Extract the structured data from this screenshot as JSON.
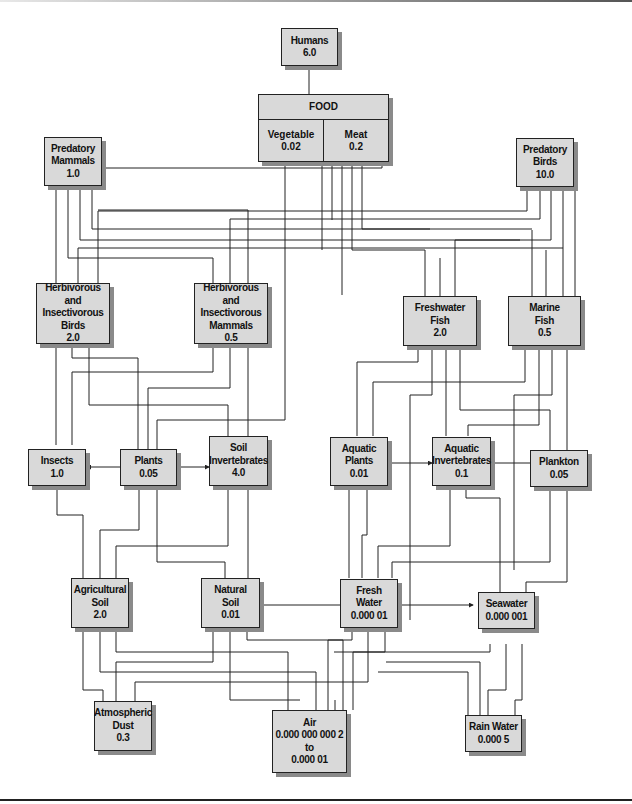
{
  "diagram": {
    "type": "food-web / environmental transfer flow diagram",
    "nodes": {
      "humans": {
        "name": "Humans",
        "value": "6.0"
      },
      "food": {
        "name": "FOOD",
        "vegetable_label": "Vegetable",
        "vegetable_value": "0.02",
        "meat_label": "Meat",
        "meat_value": "0.2"
      },
      "predatory_mammals": {
        "line1": "Predatory",
        "line2": "Mammals",
        "value": "1.0"
      },
      "predatory_birds": {
        "line1": "Predatory",
        "line2": "Birds",
        "value": "10.0"
      },
      "herb_birds": {
        "line1": "Herbivorous and",
        "line2": "Insectivorous",
        "line3": "Birds",
        "value": "2.0"
      },
      "herb_mammals": {
        "line1": "Herbivorous and",
        "line2": "Insectivorous",
        "line3": "Mammals",
        "value": "0.5"
      },
      "freshwater_fish": {
        "line1": "Freshwater",
        "line2": "Fish",
        "value": "2.0"
      },
      "marine_fish": {
        "line1": "Marine",
        "line2": "Fish",
        "value": "0.5"
      },
      "insects": {
        "line1": "Insects",
        "value": "1.0"
      },
      "plants": {
        "line1": "Plants",
        "value": "0.05"
      },
      "soil_invertebrates": {
        "line1": "Soil",
        "line2": "Invertebrates",
        "value": "4.0"
      },
      "aquatic_plants": {
        "line1": "Aquatic",
        "line2": "Plants",
        "value": "0.01"
      },
      "aquatic_invertebrates": {
        "line1": "Aquatic",
        "line2": "Invertebrates",
        "value": "0.1"
      },
      "plankton": {
        "line1": "Plankton",
        "value": "0.05"
      },
      "agricultural_soil": {
        "line1": "Agricultural",
        "line2": "Soil",
        "value": "2.0"
      },
      "natural_soil": {
        "line1": "Natural",
        "line2": "Soil",
        "value": "0.01"
      },
      "fresh_water": {
        "line1": "Fresh",
        "line2": "Water",
        "value": "0.000 01"
      },
      "seawater": {
        "line1": "Seawater",
        "value": "0.000 001"
      },
      "atmospheric_dust": {
        "line1": "Atmospheric",
        "line2": "Dust",
        "value": "0.3"
      },
      "air": {
        "line1": "Air",
        "line2": "0.000 000 000 2",
        "line3": "to",
        "value": "0.000 01"
      },
      "rain_water": {
        "line1": "Rain Water",
        "value": "0.000 5"
      }
    },
    "colors": {
      "box_fill": "#d9d9d9",
      "box_border": "#222222",
      "shadow": "#8a8a8a",
      "line": "#222222"
    }
  }
}
